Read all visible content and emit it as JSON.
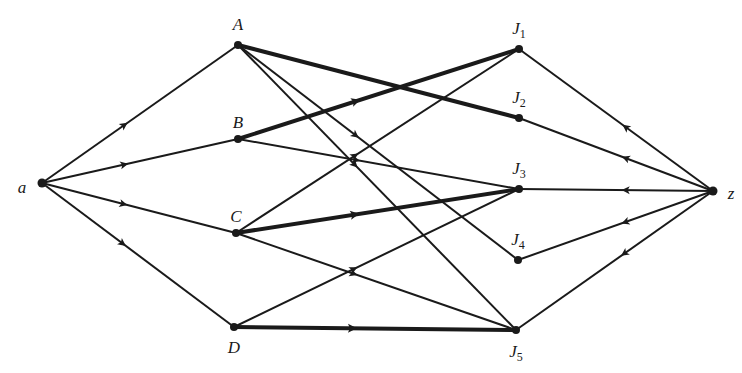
{
  "diagram": {
    "type": "directed network flow graph",
    "nodes": [
      {
        "id": "a",
        "label": "a",
        "sub": "",
        "x": 42,
        "y": 183,
        "lx": 22,
        "ly": 187
      },
      {
        "id": "A",
        "label": "A",
        "sub": "",
        "x": 238,
        "y": 45,
        "lx": 238,
        "ly": 24
      },
      {
        "id": "B",
        "label": "B",
        "sub": "",
        "x": 238,
        "y": 139,
        "lx": 238,
        "ly": 122
      },
      {
        "id": "C",
        "label": "C",
        "sub": "",
        "x": 236,
        "y": 233,
        "lx": 236,
        "ly": 216
      },
      {
        "id": "D",
        "label": "D",
        "sub": "",
        "x": 234,
        "y": 327,
        "lx": 234,
        "ly": 347
      },
      {
        "id": "J1",
        "label": "J",
        "sub": "1",
        "x": 519,
        "y": 49,
        "lx": 519,
        "ly": 30
      },
      {
        "id": "J2",
        "label": "J",
        "sub": "2",
        "x": 519,
        "y": 118,
        "lx": 519,
        "ly": 99
      },
      {
        "id": "J3",
        "label": "J",
        "sub": "3",
        "x": 519,
        "y": 189,
        "lx": 519,
        "ly": 170
      },
      {
        "id": "J4",
        "label": "J",
        "sub": "4",
        "x": 518,
        "y": 260,
        "lx": 518,
        "ly": 241
      },
      {
        "id": "J5",
        "label": "J",
        "sub": "5",
        "x": 516,
        "y": 330,
        "lx": 516,
        "ly": 353
      },
      {
        "id": "z",
        "label": "z",
        "sub": "",
        "x": 713,
        "y": 191,
        "lx": 731,
        "ly": 193
      }
    ],
    "edges": [
      {
        "from": "a",
        "to": "A",
        "weight": "thin",
        "arrow": true
      },
      {
        "from": "a",
        "to": "B",
        "weight": "thin",
        "arrow": true
      },
      {
        "from": "a",
        "to": "C",
        "weight": "thin",
        "arrow": true
      },
      {
        "from": "a",
        "to": "D",
        "weight": "thin",
        "arrow": true
      },
      {
        "from": "A",
        "to": "J2",
        "weight": "thick",
        "arrow": false
      },
      {
        "from": "A",
        "to": "J4",
        "weight": "thin",
        "arrow": true
      },
      {
        "from": "A",
        "to": "J5",
        "weight": "thin",
        "arrow": true
      },
      {
        "from": "B",
        "to": "J1",
        "weight": "thick",
        "arrow": true
      },
      {
        "from": "B",
        "to": "J3",
        "weight": "thin",
        "arrow": true
      },
      {
        "from": "C",
        "to": "J1",
        "weight": "thin",
        "arrow": true
      },
      {
        "from": "C",
        "to": "J3",
        "weight": "thick",
        "arrow": true
      },
      {
        "from": "C",
        "to": "J5",
        "weight": "thin",
        "arrow": true
      },
      {
        "from": "D",
        "to": "J3",
        "weight": "thin",
        "arrow": true
      },
      {
        "from": "D",
        "to": "J5",
        "weight": "thick",
        "arrow": true
      },
      {
        "from": "z",
        "to": "J1",
        "weight": "thin",
        "arrow": true
      },
      {
        "from": "z",
        "to": "J2",
        "weight": "thin",
        "arrow": true
      },
      {
        "from": "z",
        "to": "J3",
        "weight": "thin",
        "arrow": true
      },
      {
        "from": "z",
        "to": "J4",
        "weight": "thin",
        "arrow": true
      },
      {
        "from": "z",
        "to": "J5",
        "weight": "thin",
        "arrow": true
      }
    ],
    "colors": {
      "ink": "#1a1a1a",
      "background": "#ffffff"
    }
  }
}
